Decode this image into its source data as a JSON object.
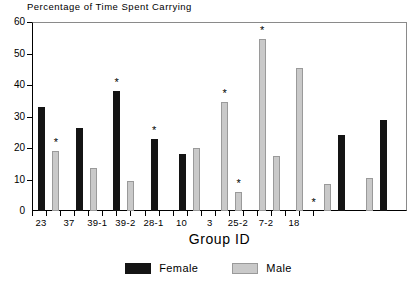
{
  "chart_data": {
    "type": "bar",
    "title": "Percentage of Time Spent Carrying",
    "xlabel": "Group ID",
    "ylabel": "",
    "ylim": [
      0,
      60
    ],
    "yticks": [
      0,
      10,
      20,
      30,
      40,
      50,
      60
    ],
    "grid": false,
    "legend_position": "bottom-center",
    "categories": [
      "23",
      "37",
      "39-1",
      "39-2",
      "28-1",
      "10",
      "3",
      "25-2",
      "7-2",
      "18"
    ],
    "series": [
      {
        "name": "Female",
        "color": "#141414",
        "values": [
          33,
          26.5,
          38,
          23,
          18,
          0,
          0,
          0,
          24,
          29
        ]
      },
      {
        "name": "Male",
        "color": "#c9c9c9",
        "values": [
          19,
          13.5,
          9.5,
          0,
          20,
          34.5,
          54.5,
          45.5,
          8.5,
          10.5
        ]
      }
    ],
    "extra_bars": [
      {
        "series": "Male",
        "after_category": "10",
        "value": 6,
        "significant": true
      },
      {
        "series": "Male",
        "after_category": "3",
        "value": 17.5,
        "significant": false
      },
      {
        "series": "Male",
        "after_category": "25-2",
        "value": 0,
        "significant": true
      }
    ],
    "significance_markers": {
      "symbol": "*",
      "marked": [
        {
          "category": "23",
          "series": "Male",
          "value": 19
        },
        {
          "category": "39-1",
          "series": "Female",
          "value": 38
        },
        {
          "category": "39-2",
          "series": "Female",
          "value": 23
        },
        {
          "category": "10",
          "series": "Male",
          "value": 34.5
        },
        {
          "category": "10",
          "series": "Male",
          "value": 6
        },
        {
          "category": "3",
          "series": "Male",
          "value": 54.5
        },
        {
          "category": "25-2",
          "series": "Male",
          "value": 0
        }
      ]
    },
    "bars": [
      {
        "id": "b01",
        "category": "23",
        "series": "Female",
        "value": 33,
        "x": 8,
        "significant": false
      },
      {
        "id": "b02",
        "category": "23",
        "series": "Male",
        "value": 19,
        "x": 26,
        "significant": true
      },
      {
        "id": "b03",
        "category": "37",
        "series": "Female",
        "value": 26.5,
        "x": 56,
        "significant": false
      },
      {
        "id": "b04",
        "category": "37",
        "series": "Male",
        "value": 13.5,
        "x": 74,
        "significant": false
      },
      {
        "id": "b05",
        "category": "39-1",
        "series": "Female",
        "value": 38,
        "x": 104,
        "significant": true
      },
      {
        "id": "b06",
        "category": "39-1",
        "series": "Male",
        "value": 9.5,
        "x": 122,
        "significant": false
      },
      {
        "id": "b07",
        "category": "39-2",
        "series": "Female",
        "value": 23,
        "x": 152,
        "significant": true
      },
      {
        "id": "b08",
        "category": "28-1",
        "series": "Female",
        "value": 18,
        "x": 188,
        "significant": false
      },
      {
        "id": "b09",
        "category": "28-1",
        "series": "Male",
        "value": 20,
        "x": 206,
        "significant": false
      },
      {
        "id": "b10",
        "category": "10",
        "series": "Male",
        "value": 34.5,
        "x": 242,
        "significant": true
      },
      {
        "id": "b11",
        "category": "10",
        "series": "Male",
        "value": 6,
        "x": 260,
        "significant": true
      },
      {
        "id": "b12",
        "category": "3",
        "series": "Male",
        "value": 54.5,
        "x": 290,
        "significant": true
      },
      {
        "id": "b13",
        "category": "3",
        "series": "Male",
        "value": 17.5,
        "x": 308,
        "significant": false
      },
      {
        "id": "b14",
        "category": "25-2",
        "series": "Male",
        "value": 45.5,
        "x": 338,
        "significant": false
      },
      {
        "id": "b15",
        "category": "25-2",
        "series": "Male",
        "value": 0,
        "x": 356,
        "significant": true
      },
      {
        "id": "b16",
        "category": "7-2",
        "series": "Male",
        "value": 8.5,
        "x": 374,
        "significant": false
      },
      {
        "id": "b17",
        "category": "7-2",
        "series": "Female",
        "value": 24,
        "x": 392,
        "significant": false
      },
      {
        "id": "b18",
        "category": "18",
        "series": "Male",
        "value": 10.5,
        "x": 428,
        "significant": false
      },
      {
        "id": "b19",
        "category": "18",
        "series": "Female",
        "value": 29,
        "x": 446,
        "significant": false
      }
    ]
  },
  "legend": {
    "entries": [
      {
        "label": "Female",
        "swatch": "female-swatch"
      },
      {
        "label": "Male",
        "swatch": "male-swatch"
      }
    ]
  }
}
